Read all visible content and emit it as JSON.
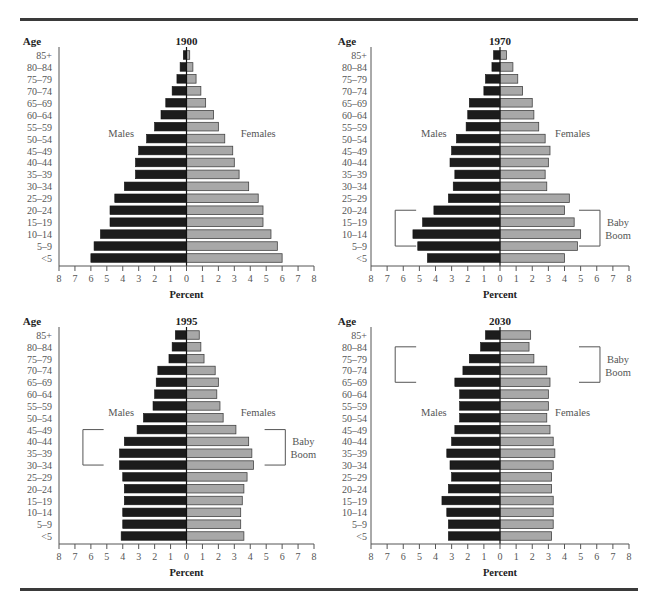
{
  "chart_data": [
    {
      "type": "bar",
      "subtype": "population-pyramid",
      "title": "1900",
      "age_label": "Age",
      "xlabel": "Percent",
      "left_label": "Males",
      "right_label": "Females",
      "xlim": [
        -8,
        8
      ],
      "x_ticks": [
        "8",
        "7",
        "6",
        "5",
        "4",
        "3",
        "2",
        "1",
        "0",
        "1",
        "2",
        "3",
        "4",
        "5",
        "6",
        "7",
        "8"
      ],
      "categories": [
        "85+",
        "80–84",
        "75–79",
        "70–74",
        "65–69",
        "60–64",
        "55–59",
        "50–54",
        "45–49",
        "40–44",
        "35–39",
        "30–34",
        "25–29",
        "20–24",
        "15–19",
        "10–14",
        "5–9",
        "<5"
      ],
      "series": [
        {
          "name": "Males",
          "color": "#1c1c1c",
          "values": [
            0.2,
            0.4,
            0.6,
            0.9,
            1.3,
            1.6,
            2.0,
            2.5,
            3.0,
            3.2,
            3.2,
            3.9,
            4.5,
            4.8,
            4.8,
            5.4,
            5.8,
            6.0
          ]
        },
        {
          "name": "Females",
          "color": "#a8a8a8",
          "values": [
            0.2,
            0.4,
            0.6,
            0.9,
            1.2,
            1.7,
            2.0,
            2.4,
            2.9,
            3.0,
            3.3,
            3.9,
            4.5,
            4.8,
            4.8,
            5.3,
            5.7,
            6.0
          ]
        }
      ],
      "annotation": null
    },
    {
      "type": "bar",
      "subtype": "population-pyramid",
      "title": "1970",
      "age_label": "Age",
      "xlabel": "Percent",
      "left_label": "Males",
      "right_label": "Females",
      "xlim": [
        -8,
        8
      ],
      "x_ticks": [
        "8",
        "7",
        "6",
        "5",
        "4",
        "3",
        "2",
        "1",
        "0",
        "1",
        "2",
        "3",
        "4",
        "5",
        "6",
        "7",
        "8"
      ],
      "categories": [
        "85+",
        "80–84",
        "75–79",
        "70–74",
        "65–69",
        "60–64",
        "55–59",
        "50–54",
        "45–49",
        "40–44",
        "35–39",
        "30–34",
        "25–29",
        "20–24",
        "15–19",
        "10–14",
        "5–9",
        "<5"
      ],
      "series": [
        {
          "name": "Males",
          "color": "#1c1c1c",
          "values": [
            0.4,
            0.5,
            0.9,
            1.0,
            1.9,
            2.0,
            2.1,
            2.7,
            3.0,
            3.1,
            2.8,
            2.9,
            3.2,
            4.1,
            4.8,
            5.4,
            5.1,
            4.5
          ]
        },
        {
          "name": "Females",
          "color": "#a8a8a8",
          "values": [
            0.4,
            0.8,
            1.1,
            1.4,
            2.0,
            2.1,
            2.4,
            2.8,
            3.1,
            3.0,
            2.8,
            2.9,
            4.3,
            4.0,
            4.6,
            5.0,
            4.8,
            4.0
          ]
        }
      ],
      "annotation": {
        "text_line1": "Baby",
        "text_line2": "Boom",
        "from": "20–24",
        "to": "5–9"
      }
    },
    {
      "type": "bar",
      "subtype": "population-pyramid",
      "title": "1995",
      "age_label": "Age",
      "xlabel": "Percent",
      "left_label": "Males",
      "right_label": "Females",
      "xlim": [
        -8,
        8
      ],
      "x_ticks": [
        "8",
        "7",
        "6",
        "5",
        "4",
        "3",
        "2",
        "1",
        "0",
        "1",
        "2",
        "3",
        "4",
        "5",
        "6",
        "7",
        "8"
      ],
      "categories": [
        "85+",
        "80–84",
        "75–79",
        "70–74",
        "65–69",
        "60–64",
        "55–59",
        "50–54",
        "45–49",
        "40–44",
        "35–39",
        "30–34",
        "25–29",
        "20–24",
        "15–19",
        "10–14",
        "5–9",
        "<5"
      ],
      "series": [
        {
          "name": "Males",
          "color": "#1c1c1c",
          "values": [
            0.7,
            0.9,
            1.1,
            1.8,
            1.9,
            2.0,
            2.1,
            2.7,
            3.1,
            3.9,
            4.2,
            4.2,
            4.0,
            3.9,
            3.9,
            4.0,
            4.0,
            4.1
          ]
        },
        {
          "name": "Females",
          "color": "#a8a8a8",
          "values": [
            0.8,
            0.9,
            1.1,
            1.8,
            2.0,
            1.9,
            2.1,
            2.3,
            3.1,
            3.9,
            4.1,
            4.2,
            3.8,
            3.6,
            3.5,
            3.4,
            3.4,
            3.6
          ]
        }
      ],
      "annotation": {
        "text_line1": "Baby",
        "text_line2": "Boom",
        "from": "45–49",
        "to": "30–34"
      }
    },
    {
      "type": "bar",
      "subtype": "population-pyramid",
      "title": "2030",
      "age_label": "Age",
      "xlabel": "Percent",
      "left_label": "Males",
      "right_label": "Females",
      "xlim": [
        -8,
        8
      ],
      "x_ticks": [
        "8",
        "7",
        "6",
        "5",
        "4",
        "3",
        "2",
        "1",
        "0",
        "1",
        "2",
        "3",
        "4",
        "5",
        "6",
        "7",
        "8"
      ],
      "categories": [
        "85+",
        "80–84",
        "75–79",
        "70–74",
        "65–69",
        "60–64",
        "55–59",
        "50–54",
        "45–49",
        "40–44",
        "35–39",
        "30–34",
        "25–29",
        "20–24",
        "15–19",
        "10–14",
        "5–9",
        "<5"
      ],
      "series": [
        {
          "name": "Males",
          "color": "#1c1c1c",
          "values": [
            0.9,
            1.2,
            1.9,
            2.3,
            2.8,
            2.5,
            2.5,
            2.5,
            2.8,
            3.0,
            3.3,
            3.1,
            3.0,
            3.2,
            3.6,
            3.3,
            3.2,
            3.2
          ]
        },
        {
          "name": "Females",
          "color": "#a8a8a8",
          "values": [
            1.9,
            1.8,
            2.1,
            2.9,
            3.1,
            3.0,
            3.0,
            2.9,
            3.1,
            3.3,
            3.4,
            3.3,
            3.2,
            3.2,
            3.3,
            3.3,
            3.3,
            3.2
          ]
        }
      ],
      "annotation": {
        "text_line1": "Baby",
        "text_line2": "Boom",
        "from": "80–84",
        "to": "65–69"
      }
    }
  ]
}
